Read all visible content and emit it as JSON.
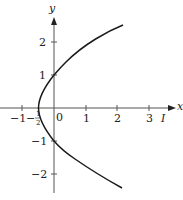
{
  "figure": {
    "axis_labels": {
      "x": "x",
      "y": "y"
    },
    "curve_label": "I",
    "x_ticks": [
      {
        "value": -1,
        "label": "−1"
      },
      {
        "value": -0.5,
        "label_num": "1",
        "label_den": "2",
        "label_sign": "−"
      },
      {
        "value": 0,
        "label": "0"
      },
      {
        "value": 1,
        "label": "1"
      },
      {
        "value": 2,
        "label": "2"
      },
      {
        "value": 3,
        "label": "3"
      }
    ],
    "y_ticks": [
      {
        "value": 2,
        "label": "2"
      },
      {
        "value": 1,
        "label": "1"
      },
      {
        "value": -1,
        "label": "−1"
      },
      {
        "value": -2,
        "label": "−2"
      }
    ],
    "curve": {
      "description": "Parabola opening to the right with vertex at (-1/2, 0), crossing the y-axis at y=1 and y=-1",
      "equation": "x = (y^2 - 1)/2",
      "color": "#1a1a1a"
    },
    "axis_color": "#555555"
  }
}
